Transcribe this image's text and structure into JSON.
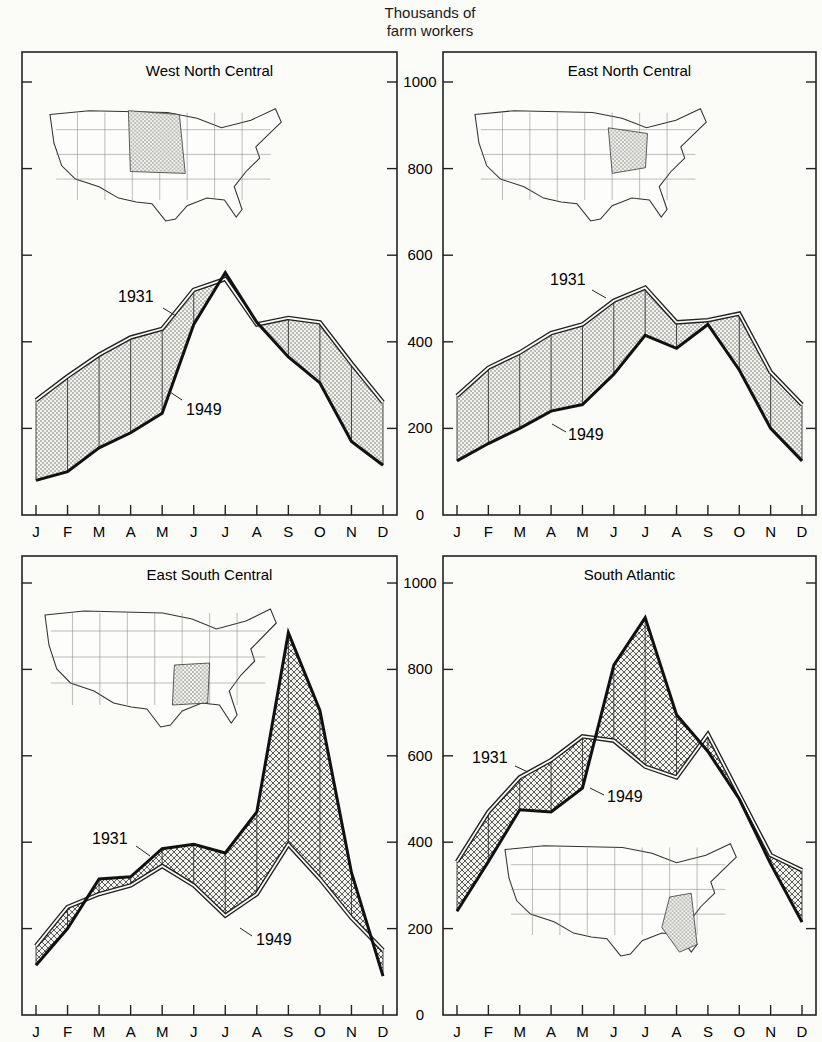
{
  "figure": {
    "y_axis_title_line1": "Thousands of",
    "y_axis_title_line2": "farm workers",
    "y_ticks": [
      0,
      200,
      400,
      600,
      800,
      1000
    ],
    "months": [
      "J",
      "F",
      "M",
      "A",
      "M",
      "J",
      "J",
      "A",
      "S",
      "O",
      "N",
      "D"
    ],
    "series_labels": [
      "1931",
      "1949"
    ]
  },
  "chart_data": [
    {
      "type": "line",
      "title": "West North Central",
      "xlabel": "",
      "ylabel": "Thousands of farm workers",
      "categories": [
        "J",
        "F",
        "M",
        "A",
        "M",
        "J",
        "J",
        "A",
        "S",
        "O",
        "N",
        "D"
      ],
      "ylim": [
        0,
        1000
      ],
      "grid": true,
      "series": [
        {
          "name": "1931",
          "values": [
            265,
            320,
            370,
            410,
            430,
            520,
            545,
            440,
            455,
            445,
            350,
            260
          ]
        },
        {
          "name": "1949",
          "values": [
            80,
            100,
            155,
            190,
            235,
            440,
            560,
            445,
            365,
            305,
            170,
            115
          ]
        }
      ]
    },
    {
      "type": "line",
      "title": "East North Central",
      "xlabel": "",
      "ylabel": "Thousands of farm workers",
      "categories": [
        "J",
        "F",
        "M",
        "A",
        "M",
        "J",
        "J",
        "A",
        "S",
        "O",
        "N",
        "D"
      ],
      "ylim": [
        0,
        1000
      ],
      "grid": true,
      "series": [
        {
          "name": "1931",
          "values": [
            275,
            340,
            375,
            420,
            440,
            495,
            525,
            445,
            450,
            465,
            330,
            255
          ]
        },
        {
          "name": "1949",
          "values": [
            125,
            165,
            200,
            240,
            255,
            325,
            415,
            385,
            440,
            335,
            200,
            125
          ]
        }
      ]
    },
    {
      "type": "line",
      "title": "East South Central",
      "xlabel": "",
      "ylabel": "Thousands of farm workers",
      "categories": [
        "J",
        "F",
        "M",
        "A",
        "M",
        "J",
        "J",
        "A",
        "S",
        "O",
        "N",
        "D"
      ],
      "ylim": [
        0,
        1000
      ],
      "grid": true,
      "series": [
        {
          "name": "1931",
          "values": [
            160,
            250,
            280,
            300,
            345,
            300,
            230,
            280,
            395,
            315,
            225,
            150
          ]
        },
        {
          "name": "1949",
          "values": [
            115,
            200,
            315,
            320,
            385,
            395,
            375,
            470,
            885,
            705,
            330,
            90
          ]
        }
      ]
    },
    {
      "type": "line",
      "title": "South Atlantic",
      "xlabel": "",
      "ylabel": "Thousands of farm workers",
      "categories": [
        "J",
        "F",
        "M",
        "A",
        "M",
        "J",
        "J",
        "A",
        "S",
        "O",
        "N",
        "D"
      ],
      "ylim": [
        0,
        1000
      ],
      "grid": true,
      "series": [
        {
          "name": "1931",
          "values": [
            355,
            470,
            550,
            590,
            645,
            635,
            575,
            550,
            650,
            510,
            370,
            335
          ]
        },
        {
          "name": "1949",
          "values": [
            240,
            355,
            475,
            470,
            525,
            810,
            920,
            695,
            610,
            500,
            350,
            215
          ]
        }
      ]
    }
  ]
}
